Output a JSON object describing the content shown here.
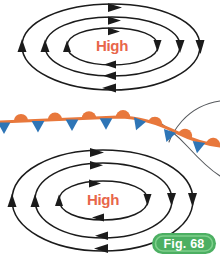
{
  "figure": {
    "caption_label": "Fig. 68",
    "background_color": "#ffffff",
    "width": 220,
    "height": 259
  },
  "colors": {
    "warm_front_orange": "#E8783C",
    "cold_front_blue": "#2E75B6",
    "isobar_black": "#1b1b1b",
    "trough_gray": "#55585c",
    "high_label_red": "#E8664A",
    "badge_green_outer": "#4CAF62",
    "badge_green_inner": "#7FD08C",
    "badge_text_white": "#ffffff"
  },
  "systems": [
    {
      "id": "high-pressure-north",
      "label": "High",
      "position": "top",
      "rotation": "clockwise",
      "center_x": 112,
      "center_y": 44,
      "isobar_count": 3
    },
    {
      "id": "high-pressure-south",
      "label": "High",
      "position": "bottom",
      "rotation": "clockwise",
      "center_x": 103,
      "center_y": 200,
      "isobar_count": 3
    }
  ],
  "front": {
    "type": "occluded",
    "warm_symbol": "semicircle",
    "cold_symbol": "triangle",
    "warm_symbol_side": "above",
    "cold_symbol_side": "below",
    "warm_symbol_count": 7,
    "cold_symbol_count": 6,
    "orientation": "west-to-east"
  },
  "troughs": [
    {
      "id": "trough-upper-right"
    },
    {
      "id": "trough-lower-right"
    }
  ]
}
